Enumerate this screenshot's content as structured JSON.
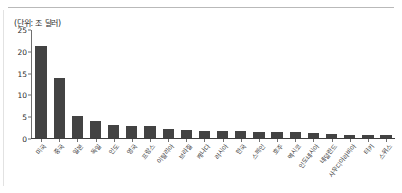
{
  "unit_note": "(단위: 조 달러)",
  "chart_data": {
    "type": "bar",
    "title": "",
    "subtitle": "",
    "xlabel": "",
    "ylabel": "",
    "unit": "(단위: 조 달러)",
    "ylim": [
      0,
      25
    ],
    "yticks": [
      0,
      5,
      10,
      15,
      20,
      25
    ],
    "grid": false,
    "legend": "none",
    "bar_color": "#434343",
    "axis_color": "#6f6f6f",
    "categories": [
      "미국",
      "중국",
      "일본",
      "독일",
      "인도",
      "영국",
      "프랑스",
      "이탈리아",
      "브라질",
      "캐나다",
      "러시아",
      "한국",
      "스페인",
      "호주",
      "멕시코",
      "인도네시아",
      "네덜란드",
      "사우디아라비아",
      "터키",
      "스위스"
    ],
    "values": [
      21.4,
      14.0,
      5.0,
      3.9,
      2.9,
      2.8,
      2.7,
      2.1,
      1.8,
      1.7,
      1.7,
      1.6,
      1.4,
      1.4,
      1.3,
      1.1,
      0.9,
      0.8,
      0.8,
      0.7
    ]
  }
}
